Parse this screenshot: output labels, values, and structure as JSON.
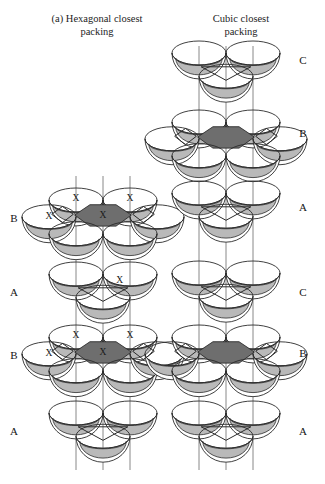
{
  "figure": {
    "panel_tag": "(a)",
    "left_title": "Hexagonal closest packing",
    "right_title": "Cubic closest packing",
    "left_title_full": "(a)  Hexagonal closest\npacking",
    "right_title_full": "Cubic closest\npacking"
  },
  "colors": {
    "outline": "#2b2b2b",
    "sphere_fill": "#ffffff",
    "shadow_fill": "#b9b9b9",
    "center_dark_fill": "#6e6e6e",
    "guide_line": "#6b6b6b",
    "text": "#1a1a1a",
    "background": "#ffffff"
  },
  "left_column": {
    "name": "hexagonal-closest-packing",
    "sequence": "B A B A",
    "layers": [
      {
        "label": "B",
        "label_x": 14,
        "label_y": 219,
        "cluster": "hex-ring",
        "center_x": 103,
        "center_y": 215,
        "dark_center": true,
        "x_marks": [
          "upper-left",
          "upper-right",
          "left",
          "center"
        ]
      },
      {
        "label": "A",
        "label_x": 14,
        "label_y": 293,
        "cluster": "tri-group",
        "center_x": 103,
        "center_y": 289,
        "dark_center": false,
        "x_marks": [
          "top"
        ]
      },
      {
        "label": "B",
        "label_x": 14,
        "label_y": 356,
        "cluster": "hex-ring",
        "center_x": 103,
        "center_y": 352,
        "dark_center": true,
        "x_marks": [
          "upper-left",
          "upper-right",
          "left",
          "center"
        ]
      },
      {
        "label": "A",
        "label_x": 14,
        "label_y": 432,
        "cluster": "tri-group",
        "center_x": 103,
        "center_y": 428,
        "dark_center": false,
        "x_marks": []
      }
    ],
    "guide_lines": [
      {
        "x": 76,
        "y1": 176,
        "y2": 470
      },
      {
        "x": 103,
        "y1": 176,
        "y2": 470
      },
      {
        "x": 130,
        "y1": 176,
        "y2": 470
      }
    ]
  },
  "right_column": {
    "name": "cubic-closest-packing",
    "sequence": "C B A C B A",
    "layers": [
      {
        "label": "C",
        "label_x": 303,
        "label_y": 61,
        "cluster": "tri-group",
        "center_x": 226,
        "center_y": 68,
        "dark_center": false,
        "x_marks": []
      },
      {
        "label": "B",
        "label_x": 303,
        "label_y": 134,
        "cluster": "hex-ring",
        "center_x": 226,
        "center_y": 137,
        "dark_center": true,
        "x_marks": []
      },
      {
        "label": "A",
        "label_x": 303,
        "label_y": 208,
        "cluster": "tri-group",
        "center_x": 226,
        "center_y": 208,
        "dark_center": false,
        "x_marks": []
      },
      {
        "label": "C",
        "label_x": 303,
        "label_y": 293,
        "cluster": "tri-group",
        "center_x": 226,
        "center_y": 288,
        "dark_center": false,
        "x_marks": []
      },
      {
        "label": "B",
        "label_x": 303,
        "label_y": 354,
        "cluster": "hex-ring",
        "center_x": 226,
        "center_y": 352,
        "dark_center": true,
        "x_marks": []
      },
      {
        "label": "A",
        "label_x": 303,
        "label_y": 432,
        "cluster": "tri-group",
        "center_x": 226,
        "center_y": 428,
        "dark_center": false,
        "x_marks": []
      }
    ],
    "guide_lines": [
      {
        "x": 199,
        "y1": 46,
        "y2": 470
      },
      {
        "x": 226,
        "y1": 46,
        "y2": 470
      },
      {
        "x": 253,
        "y1": 46,
        "y2": 470
      }
    ]
  },
  "geometry": {
    "sphere_rx": 27,
    "sphere_ry": 12,
    "bowl_depth": 17,
    "tri_offset_x": 27,
    "tri_offset_y": 15,
    "hex_offset_x": 27,
    "hex_offset_y": 15
  },
  "x_label": "X"
}
